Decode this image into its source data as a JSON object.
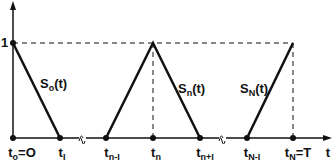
{
  "diagram": {
    "type": "piecewise-linear hat functions",
    "colors": {
      "line": "#111111",
      "background": "#ffffff"
    },
    "y_axis": {
      "level_label": "1"
    },
    "x_axis": {
      "end_label": "t"
    },
    "ticks": [
      {
        "base": "t",
        "sub": "o",
        "suffix": "=O"
      },
      {
        "base": "t",
        "sub": "I",
        "suffix": ""
      },
      {
        "base": "t",
        "sub": "n-I",
        "suffix": ""
      },
      {
        "base": "t",
        "sub": "n",
        "suffix": ""
      },
      {
        "base": "t",
        "sub": "n+I",
        "suffix": ""
      },
      {
        "base": "t",
        "sub": "N-I",
        "suffix": ""
      },
      {
        "base": "t",
        "sub": "N",
        "suffix": "=T"
      }
    ],
    "functions": [
      {
        "base": "S",
        "sub": "o",
        "arg": "(t)"
      },
      {
        "base": "S",
        "sub": "n",
        "arg": "(t)"
      },
      {
        "base": "S",
        "sub": "N",
        "arg": "(t)"
      }
    ],
    "axis_break_symbol": "≈"
  }
}
